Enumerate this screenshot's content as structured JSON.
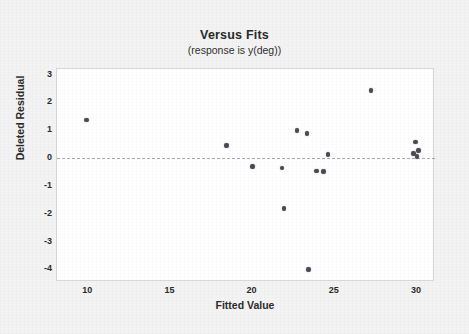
{
  "chart_data": {
    "type": "scatter",
    "title": "Versus Fits",
    "subtitle": "(response is y(deg))",
    "xlabel": "Fitted Value",
    "ylabel": "Deleted Residual",
    "xlim": [
      8.1,
      31.1
    ],
    "ylim": [
      -4.45,
      3.2
    ],
    "xticks": [
      10,
      15,
      20,
      25,
      30
    ],
    "yticks": [
      3,
      2,
      1,
      0,
      -1,
      -2,
      -3,
      -4
    ],
    "xtick_labels": [
      "10",
      "15",
      "20",
      "25",
      "30"
    ],
    "ytick_labels": [
      "3",
      "2",
      "1",
      "0",
      "-1",
      "-2",
      "-3",
      "-4"
    ],
    "grid": false,
    "legend": false,
    "reference_line": {
      "orientation": "horizontal",
      "y": 0,
      "style": "dashed",
      "color": "#9a9aa5"
    },
    "marker": {
      "shape": "circle",
      "color": "#4a4a55",
      "size": 4.6
    },
    "series": [
      {
        "name": "Deleted Residual vs Fitted Value",
        "points": [
          {
            "x": 9.9,
            "y": 1.37
          },
          {
            "x": 18.4,
            "y": 0.46
          },
          {
            "x": 20.0,
            "y": -0.31
          },
          {
            "x": 21.8,
            "y": -0.35
          },
          {
            "x": 21.9,
            "y": -1.82
          },
          {
            "x": 22.7,
            "y": 0.99
          },
          {
            "x": 23.3,
            "y": 0.88
          },
          {
            "x": 23.4,
            "y": -4.01
          },
          {
            "x": 23.9,
            "y": -0.47
          },
          {
            "x": 24.3,
            "y": -0.48
          },
          {
            "x": 24.6,
            "y": 0.13
          },
          {
            "x": 27.2,
            "y": 2.42
          },
          {
            "x": 29.8,
            "y": 0.16
          },
          {
            "x": 29.9,
            "y": 0.58
          },
          {
            "x": 30.1,
            "y": 0.28
          },
          {
            "x": 30.0,
            "y": 0.05
          }
        ]
      }
    ]
  }
}
